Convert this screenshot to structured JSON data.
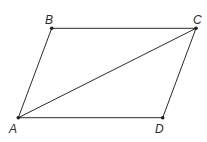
{
  "diagram": {
    "title": "",
    "shape": "parallelogram",
    "vertices": [
      {
        "id": "A",
        "label": "A",
        "x": 18.3,
        "y": 117.7,
        "label_x": 9,
        "label_y": 133
      },
      {
        "id": "B",
        "label": "B",
        "x": 51.7,
        "y": 28.3,
        "label_x": 45,
        "label_y": 24
      },
      {
        "id": "C",
        "label": "C",
        "x": 196,
        "y": 28.3,
        "label_x": 193,
        "label_y": 24
      },
      {
        "id": "D",
        "label": "D",
        "x": 162.7,
        "y": 117.7,
        "label_x": 155,
        "label_y": 133
      }
    ],
    "edges": [
      {
        "from": "A",
        "to": "B"
      },
      {
        "from": "B",
        "to": "C"
      },
      {
        "from": "C",
        "to": "D"
      },
      {
        "from": "D",
        "to": "A"
      },
      {
        "from": "A",
        "to": "C",
        "kind": "diagonal"
      }
    ],
    "colors": {
      "line": "#2b2b2b",
      "point": "#1f1f1f",
      "background": "#ffffff"
    }
  }
}
